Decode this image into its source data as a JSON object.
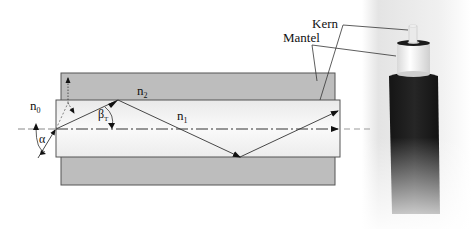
{
  "diagram": {
    "labels": {
      "n0": "n",
      "n0_sub": "0",
      "n1": "n",
      "n1_sub": "1",
      "n2": "n",
      "n2_sub": "2",
      "alpha": "α",
      "beta": "β",
      "beta_sub": "T",
      "kern": "Kern",
      "mantel": "Mantel"
    },
    "regions": [
      {
        "name": "cladding",
        "label": "Mantel",
        "index": "n2",
        "color": "#b8b8b8"
      },
      {
        "name": "core",
        "label": "Kern",
        "index": "n1",
        "color": "#f2f2f2"
      },
      {
        "name": "outside",
        "index": "n0",
        "color": "#ffffff"
      }
    ],
    "rays": [
      {
        "name": "incident-ray",
        "from": "outside",
        "to": "core-entry"
      },
      {
        "name": "zigzag-ray",
        "description": "total internal reflection path"
      },
      {
        "name": "axial-ray",
        "description": "ray along optical axis"
      }
    ],
    "photo": {
      "description": "fiber optic cable cross-section photo showing Kern and Mantel"
    }
  }
}
